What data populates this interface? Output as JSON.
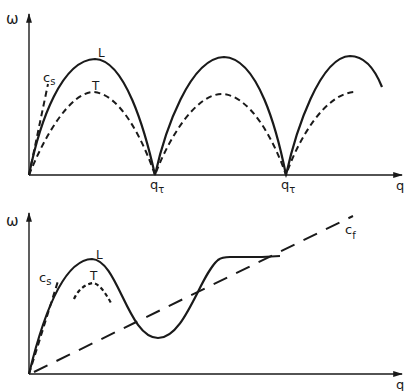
{
  "top_panel": {
    "y_axis_label": "ω",
    "x_axis_label": "q",
    "curve_labels": {
      "longitudinal": "L",
      "transverse": "T",
      "sound_speed": "c",
      "sound_speed_sub": "s"
    },
    "tick_labels": [
      {
        "main": "q",
        "sub": "τ"
      },
      {
        "main": "q",
        "sub": "τ"
      }
    ]
  },
  "bottom_panel": {
    "y_axis_label": "ω",
    "x_axis_label": "q",
    "curve_labels": {
      "longitudinal": "L",
      "transverse": "T",
      "sound_speed": "c",
      "sound_speed_sub": "s",
      "fast_speed": "c",
      "fast_speed_sub": "f"
    }
  },
  "colors": {
    "ink": "#1a1a1a",
    "background": "#ffffff"
  }
}
